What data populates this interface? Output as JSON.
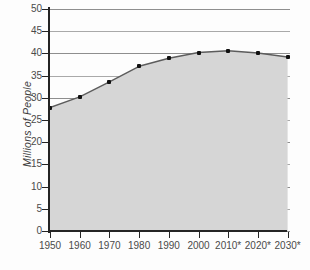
{
  "chart_data": {
    "type": "area",
    "title": "",
    "xlabel": "",
    "ylabel": "Millions of People",
    "categories": [
      "1950",
      "1960",
      "1970",
      "1980",
      "1990",
      "2000",
      "2010*",
      "2020*",
      "2030*"
    ],
    "x": [
      1950,
      1960,
      1970,
      1980,
      1990,
      2000,
      2010,
      2020,
      2030
    ],
    "values": [
      27.8,
      30.2,
      33.6,
      37.1,
      38.9,
      40.2,
      40.6,
      40.1,
      39.2
    ],
    "series": [
      {
        "name": "Population",
        "values": [
          27.8,
          30.2,
          33.6,
          37.1,
          38.9,
          40.2,
          40.6,
          40.1,
          39.2
        ]
      }
    ],
    "ylim": [
      0,
      50
    ],
    "yticks": [
      0,
      5,
      10,
      15,
      20,
      25,
      30,
      35,
      40,
      45,
      50
    ],
    "ytick_labels": [
      "0",
      "5",
      "10",
      "15",
      "20",
      "25",
      "30",
      "35",
      "40",
      "45",
      "50"
    ],
    "xtick_labels": [
      "1950",
      "1960",
      "1970",
      "1980",
      "1990",
      "2000",
      "2010*",
      "2020*",
      "2030*"
    ],
    "grid": true,
    "legend": "none",
    "colors": {
      "fill": "#d6d6d6",
      "line": "#585858",
      "marker": "#111111",
      "grid": "#8e8e8e",
      "axis": "#242424",
      "text": "#4a4a4a"
    },
    "annotations": [
      "* denotes projected values"
    ]
  }
}
